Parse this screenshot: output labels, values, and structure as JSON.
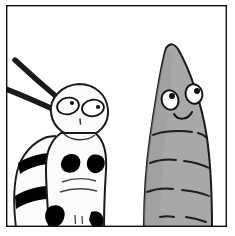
{
  "panel": {
    "kind": "comic-panel",
    "caption": "",
    "width": 235,
    "height": 236,
    "background_color": "#ffffff",
    "border": {
      "color": "#111111",
      "width": 1.4,
      "x": 6,
      "y": 5,
      "w": 221,
      "h": 222
    }
  },
  "characters": [
    {
      "id": "striped-caterpillar",
      "name": "striped caterpillar",
      "position": "left",
      "body_color": "#fbfbfb",
      "outline_color": "#1a1a1a",
      "marking_color": "#000000",
      "expression": "neutral",
      "features": {
        "antennae_count": 2,
        "eyes_count": 2,
        "stripes_count": 2,
        "spots_count": 4,
        "mouth": "small-tick"
      },
      "eyes": [
        {
          "side": "left",
          "cx": 68,
          "cy": 106,
          "rx": 11,
          "ry": 8.5,
          "rot": -12,
          "pupil_cx": 72,
          "pupil_cy": 103,
          "pupil_r": 2.1
        },
        {
          "side": "right",
          "cx": 93,
          "cy": 108,
          "rx": 11,
          "ry": 8.5,
          "rot": -8,
          "pupil_cx": 98,
          "pupil_cy": 107,
          "pupil_r": 2.1
        }
      ]
    },
    {
      "id": "gray-pupa",
      "name": "gray pupa",
      "position": "right",
      "body_color": "#a8a8a8",
      "body_shade_color": "#9a9a9a",
      "outline_color": "#1a1a1a",
      "expression": "smiling",
      "features": {
        "segments_count": 5,
        "eyes_count": 2,
        "mouth": "smile",
        "shape": "cone"
      },
      "eyes": [
        {
          "side": "left",
          "cx": 170,
          "cy": 99,
          "rx": 8.5,
          "ry": 10,
          "rot": -14,
          "pupil_cx": 172,
          "pupil_cy": 96,
          "pupil_r": 3.0
        },
        {
          "side": "right",
          "cx": 194,
          "cy": 94,
          "rx": 8.5,
          "ry": 10,
          "rot": -10,
          "pupil_cx": 197,
          "pupil_cy": 91,
          "pupil_r": 3.0
        }
      ]
    }
  ],
  "palette": {
    "ink": "#1a1a1a",
    "paper": "#ffffff",
    "body_white": "#fbfbfb",
    "body_gray": "#a8a8a8",
    "body_gray_dark": "#9a9a9a",
    "marking_black": "#000000"
  }
}
